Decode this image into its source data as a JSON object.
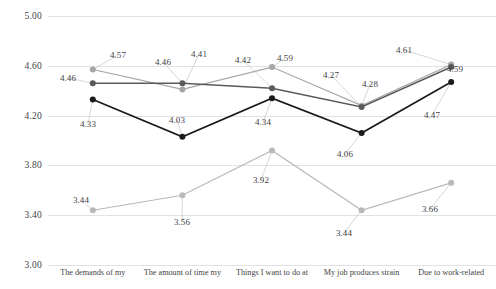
{
  "chart_data": {
    "type": "line",
    "title": "",
    "xlabel": "",
    "ylabel": "",
    "ylim": [
      3.0,
      5.0
    ],
    "grid": true,
    "legend_position": "none",
    "ytick_labels": [
      "5.00",
      "4.60",
      "4.20",
      "3.80",
      "3.40",
      "3.00"
    ],
    "ytick_values": [
      5.0,
      4.6,
      4.2,
      3.8,
      3.4,
      3.0
    ],
    "categories": [
      "The demands of my",
      "The amount of time my",
      "Things I want to do at",
      "My job produces strain",
      "Due to work-related"
    ],
    "series": [
      {
        "name": "series-upper-light",
        "color": "#a6a6a6",
        "values": [
          4.57,
          4.41,
          4.59,
          4.28,
          4.61
        ],
        "labels": [
          "4.57",
          "4.41",
          "4.59",
          "4.28",
          "4.61"
        ]
      },
      {
        "name": "series-mid-dark",
        "color": "#5a5a5a",
        "values": [
          4.46,
          4.46,
          4.42,
          4.27,
          4.59
        ],
        "labels": [
          "4.46",
          "4.46",
          "4.42",
          "4.27",
          "4.59"
        ]
      },
      {
        "name": "series-lower-black",
        "color": "#1a1a1a",
        "values": [
          4.33,
          4.03,
          4.34,
          4.06,
          4.47
        ],
        "labels": [
          "4.33",
          "4.03",
          "4.34",
          "4.06",
          "4.47"
        ]
      },
      {
        "name": "series-bottom-light",
        "color": "#b9b9b9",
        "values": [
          3.44,
          3.56,
          3.92,
          3.44,
          3.66
        ],
        "labels": [
          "3.44",
          "3.56",
          "3.92",
          "3.44",
          "3.66"
        ]
      }
    ],
    "data_label_positions": [
      {
        "series": 0,
        "index": 0,
        "text": "4.57",
        "x": 118,
        "y": 55
      },
      {
        "series": 0,
        "index": 1,
        "text": "4.41",
        "x": 199,
        "y": 54
      },
      {
        "series": 0,
        "index": 2,
        "text": "4.59",
        "x": 285,
        "y": 58
      },
      {
        "series": 0,
        "index": 3,
        "text": "4.28",
        "x": 370,
        "y": 84
      },
      {
        "series": 0,
        "index": 4,
        "text": "4.61",
        "x": 404,
        "y": 50
      },
      {
        "series": 1,
        "index": 0,
        "text": "4.46",
        "x": 68,
        "y": 78
      },
      {
        "series": 1,
        "index": 1,
        "text": "4.46",
        "x": 163,
        "y": 62
      },
      {
        "series": 1,
        "index": 2,
        "text": "4.42",
        "x": 243,
        "y": 60
      },
      {
        "series": 1,
        "index": 3,
        "text": "4.27",
        "x": 331,
        "y": 75
      },
      {
        "series": 1,
        "index": 4,
        "text": "4.59",
        "x": 455,
        "y": 69
      },
      {
        "series": 2,
        "index": 0,
        "text": "4.33",
        "x": 88,
        "y": 124
      },
      {
        "series": 2,
        "index": 1,
        "text": "4.03",
        "x": 177,
        "y": 120
      },
      {
        "series": 2,
        "index": 2,
        "text": "4.34",
        "x": 263,
        "y": 122
      },
      {
        "series": 2,
        "index": 3,
        "text": "4.06",
        "x": 345,
        "y": 154
      },
      {
        "series": 2,
        "index": 4,
        "text": "4.47",
        "x": 432,
        "y": 115
      },
      {
        "series": 3,
        "index": 0,
        "text": "3.44",
        "x": 81,
        "y": 200
      },
      {
        "series": 3,
        "index": 1,
        "text": "3.56",
        "x": 182,
        "y": 222
      },
      {
        "series": 3,
        "index": 2,
        "text": "3.92",
        "x": 261,
        "y": 180
      },
      {
        "series": 3,
        "index": 3,
        "text": "3.44",
        "x": 344,
        "y": 233
      },
      {
        "series": 3,
        "index": 4,
        "text": "3.66",
        "x": 430,
        "y": 209
      }
    ]
  }
}
